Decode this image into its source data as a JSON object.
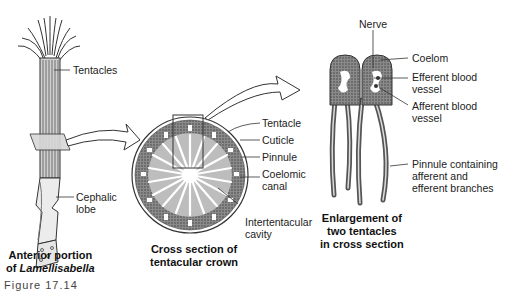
{
  "figure": {
    "caption_partial": "Figure 17.14"
  },
  "panels": {
    "anterior": {
      "caption_line1": "Anterior portion",
      "caption_line2_prefix": "of ",
      "caption_line2_italic": "Lamellisabella",
      "labels": {
        "tentacles": "Tentacles",
        "cephalic_line1": "Cephalic",
        "cephalic_line2": "lobe"
      }
    },
    "cross_section": {
      "caption_line1": "Cross section of",
      "caption_line2": "tentacular crown",
      "labels": {
        "tentacle": "Tentacle",
        "cuticle": "Cuticle",
        "pinnule": "Pinnule",
        "coelomic_line1": "Coelomic",
        "coelomic_line2": "canal",
        "intertentacular_line1": "Intertentacular",
        "intertentacular_line2": "cavity"
      }
    },
    "enlargement": {
      "caption_line1": "Enlargement of",
      "caption_line2": "two tentacles",
      "caption_line3": "in cross section",
      "labels": {
        "nerve": "Nerve",
        "coelom": "Coelom",
        "efferent_line1": "Efferent blood",
        "efferent_line2": "vessel",
        "afferent_line1": "Afferent blood",
        "afferent_line2": "vessel",
        "pinnule_line1": "Pinnule containing",
        "pinnule_line2": "afferent and",
        "pinnule_line3": "efferent branches"
      }
    }
  }
}
